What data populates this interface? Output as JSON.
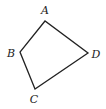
{
  "diagram": {
    "type": "quadrilateral",
    "stroke_color": "#222222",
    "vertices": [
      {
        "name": "A",
        "x": 45,
        "y": 21,
        "label_x": 45,
        "label_y": 14
      },
      {
        "name": "B",
        "x": 20,
        "y": 52,
        "label_x": 11,
        "label_y": 57
      },
      {
        "name": "C",
        "x": 35,
        "y": 89,
        "label_x": 34,
        "label_y": 103
      },
      {
        "name": "D",
        "x": 88,
        "y": 53,
        "label_x": 96,
        "label_y": 58
      }
    ],
    "edges": [
      [
        "A",
        "B"
      ],
      [
        "B",
        "C"
      ],
      [
        "C",
        "D"
      ],
      [
        "D",
        "A"
      ]
    ]
  }
}
